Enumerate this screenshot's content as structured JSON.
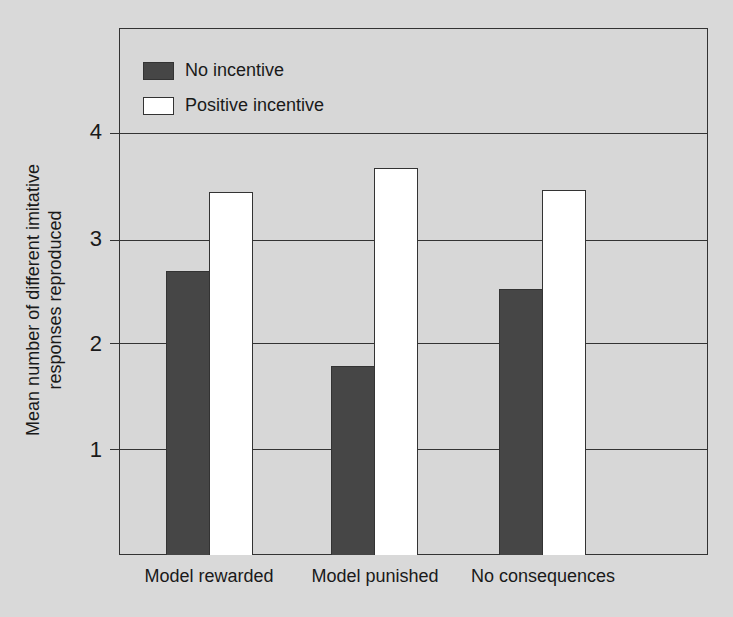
{
  "chart_data": {
    "type": "bar",
    "title": "",
    "xlabel": "",
    "ylabel": "Mean number of different imitative responses reproduced",
    "ylabel_lines": [
      "Mean number of different imitative",
      "responses reproduced"
    ],
    "categories": [
      "Model rewarded",
      "Model punished",
      "No consequences"
    ],
    "series": [
      {
        "name": "No incentive",
        "color": "#464646",
        "values": [
          2.68,
          1.78,
          2.51
        ]
      },
      {
        "name": "Positive incentive",
        "color": "#ffffff",
        "values": [
          3.42,
          3.65,
          3.44
        ]
      }
    ],
    "yticks": [
      "1",
      "2",
      "3",
      "4"
    ],
    "ylim": [
      0,
      4.95
    ],
    "grid": true,
    "legend_position": "upper left"
  },
  "legend": {
    "items": [
      {
        "label": "No incentive",
        "color": "#464646"
      },
      {
        "label": "Positive incentive",
        "color": "#ffffff"
      }
    ]
  }
}
